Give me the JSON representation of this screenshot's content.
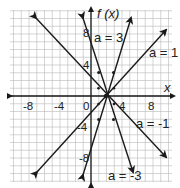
{
  "chart_data": {
    "type": "line",
    "title": "",
    "xlabel": "x",
    "ylabel": "f(x)",
    "xlim": [
      -11,
      10
    ],
    "ylim": [
      -11,
      11
    ],
    "grid": true,
    "x_ticks": [
      -8,
      -4,
      0,
      4,
      8
    ],
    "y_ticks": [
      8,
      4,
      -4,
      -8
    ],
    "x_tick_labels": [
      "-8",
      "-4",
      "0",
      "4",
      "8"
    ],
    "y_tick_labels": [
      "8",
      "4",
      "-4",
      "-8"
    ],
    "function_family": "f(x) = a(x - 2)",
    "common_point": [
      2,
      0
    ],
    "series": [
      {
        "name": "a = 3",
        "a": 3,
        "x": [
          -1,
          5.2
        ],
        "y": [
          -9,
          9.6
        ]
      },
      {
        "name": "a = 1",
        "a": 1,
        "x": [
          -7,
          9.7
        ],
        "y": [
          -9,
          7.7
        ]
      },
      {
        "name": "a = -1",
        "a": -1,
        "x": [
          -7.1,
          9.7
        ],
        "y": [
          9.1,
          -7.7
        ]
      },
      {
        "name": "a = -3",
        "a": -3,
        "x": [
          -1,
          5.4
        ],
        "y": [
          9,
          -10.2
        ]
      }
    ],
    "legend": "inline labels"
  },
  "labels": {
    "y_axis": "f (x)",
    "x_axis": "x",
    "a3": "a = 3",
    "a1": "a = 1",
    "am1": "a = -1",
    "am3": "a = -3",
    "tick_x_m8": "-8",
    "tick_x_m4": "-4",
    "tick_x_0": "0",
    "tick_x_4": "4",
    "tick_x_8": "8",
    "tick_y_8": "8",
    "tick_y_4": "4",
    "tick_y_m4": "-4",
    "tick_y_m8": "-8"
  }
}
